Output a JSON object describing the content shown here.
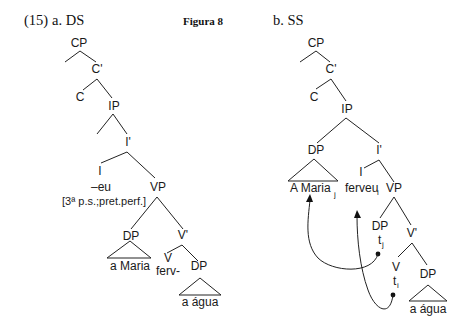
{
  "figure": {
    "example_number": "(15)",
    "caption": "Figura 8"
  },
  "tree_a": {
    "label": "a. DS",
    "nodes": {
      "cp": "CP",
      "c_bar": "C'",
      "c": "C",
      "ip": "IP",
      "i_bar": "I'",
      "i": "I",
      "i_content": "–eu",
      "i_features": "[3ª p.s.;pret.perf.]",
      "vp": "VP",
      "dp_subject": "DP",
      "dp_subject_text": "a Maria",
      "v_bar": "V'",
      "v": "V",
      "v_content": "ferv-",
      "dp_object": "DP",
      "dp_object_text": "a água"
    }
  },
  "tree_b": {
    "label": "b. SS",
    "nodes": {
      "cp": "CP",
      "c_bar": "C'",
      "c": "C",
      "ip": "IP",
      "dp_spec": "DP",
      "dp_spec_text": "A Maria",
      "dp_spec_index": "j",
      "i_bar": "I'",
      "i": "I",
      "i_content": "ferveu",
      "i_content_index": "i",
      "vp": "VP",
      "dp_trace_node": "DP",
      "dp_trace": "t",
      "dp_trace_index": "j",
      "v_bar": "V'",
      "v": "V",
      "v_trace": "t",
      "v_trace_index": "i",
      "dp_object": "DP",
      "dp_object_text": "a água"
    },
    "movements": [
      {
        "from": "DP trace t_j",
        "to": "A Maria_j"
      },
      {
        "from": "V trace t_i",
        "to": "ferveu_i"
      }
    ]
  }
}
